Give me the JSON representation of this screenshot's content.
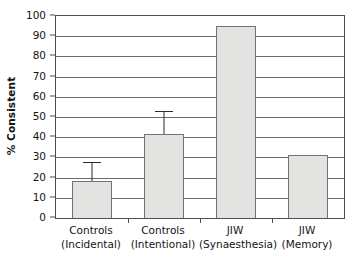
{
  "chart_data": {
    "type": "bar",
    "title": "",
    "xlabel": "",
    "ylabel": "% Consistent",
    "ylim": [
      0,
      100
    ],
    "yticks": [
      0,
      10,
      20,
      30,
      40,
      50,
      60,
      70,
      80,
      90,
      100
    ],
    "ytick_labels": [
      "0",
      "10",
      "20",
      "30",
      "40",
      "50",
      "60",
      "70",
      "80",
      "90",
      "100"
    ],
    "grid": "horizontal",
    "legend": "none",
    "categories": [
      "Controls (Incidental)",
      "Controls (Intentional)",
      "JIW (Synaesthesia)",
      "JIW (Memory)"
    ],
    "category_lines": [
      [
        "Controls",
        "(Incidental)"
      ],
      [
        "Controls",
        "(Intentional)"
      ],
      [
        "JIW",
        "(Synaesthesia)"
      ],
      [
        "JIW",
        "(Memory)"
      ]
    ],
    "values": [
      18.3,
      41.6,
      95.0,
      31.0
    ],
    "error_upper": [
      8.7,
      10.9,
      null,
      null
    ],
    "error_cap_values": [
      27.0,
      52.5,
      null,
      null
    ],
    "bar_fill_color": "#e3e3e1",
    "bar_edge_color": "#737373",
    "grid_color": "#6b6b6b",
    "axis_color": "#4d4d4d",
    "error_bar_color": "#2b2b2b",
    "background_color": "#ffffff"
  }
}
